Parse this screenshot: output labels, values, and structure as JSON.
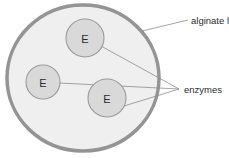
{
  "figure": {
    "background_color": "#ffffff"
  },
  "bead": {
    "name": "alginate bead",
    "fill_color": "#efefef",
    "border_color": "#949494",
    "border_width_px": 3.5,
    "center": {
      "x": 83,
      "y": 78
    },
    "radius_x": 78,
    "radius_y": 74
  },
  "enzymes": [
    {
      "label": "E",
      "center": {
        "x": 85,
        "y": 38
      },
      "radius": 19,
      "fill_color": "#d9d9d9",
      "border_color": "#9a9a9a"
    },
    {
      "label": "E",
      "center": {
        "x": 43,
        "y": 82
      },
      "radius": 17,
      "fill_color": "#d9d9d9",
      "border_color": "#9a9a9a"
    },
    {
      "label": "E",
      "center": {
        "x": 107,
        "y": 98
      },
      "radius": 19,
      "fill_color": "#d9d9d9",
      "border_color": "#9a9a9a"
    }
  ],
  "annotations": [
    {
      "id": "alginate",
      "text": "alginate l",
      "text_x": 191,
      "text_y": 20,
      "leader": {
        "x1": 142,
        "y1": 31,
        "x2": 188,
        "y2": 20
      },
      "color": "#2b2b2b"
    },
    {
      "id": "enzymes",
      "text": "enzymes",
      "text_x": 184,
      "text_y": 89,
      "convergence": {
        "x": 179,
        "y": 89
      },
      "leaders": [
        {
          "x1": 101,
          "y1": 46,
          "x2": 179,
          "y2": 89
        },
        {
          "x1": 59,
          "y1": 83,
          "x2": 179,
          "y2": 89
        },
        {
          "x1": 124,
          "y1": 106,
          "x2": 179,
          "y2": 89
        }
      ],
      "color": "#2b2b2b"
    }
  ],
  "colors": {
    "bead_fill": "#efefef",
    "bead_stroke": "#949494",
    "enzyme_fill": "#d9d9d9",
    "enzyme_stroke": "#9a9a9a",
    "leader_line": "#8d8d8d",
    "text": "#2b2b2b"
  }
}
